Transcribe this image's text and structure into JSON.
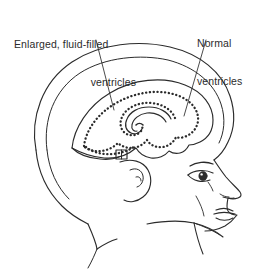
{
  "figure": {
    "type": "medical-illustration",
    "view": "lateral-profile",
    "background_color": "#ffffff",
    "line_color": "#2b2b2b",
    "labels": {
      "enlarged": {
        "line1": "Enlarged, fluid-filled",
        "line2": "ventricles"
      },
      "normal": {
        "line1": "Normal",
        "line2": "ventricles"
      }
    },
    "parts": [
      "skull-outer-outline",
      "skull-inner-outline",
      "brain-outline",
      "enlarged-ventricle-dotted-outline",
      "normal-ventricle-inner-outline",
      "brainstem-connector",
      "ear",
      "eyebrow",
      "eye",
      "nose",
      "lips",
      "chin",
      "neck",
      "shoulder"
    ],
    "leader_lines": [
      {
        "name": "leader-enlarged",
        "from": [
          96,
          40
        ],
        "to": [
          114,
          110
        ]
      },
      {
        "name": "leader-normal",
        "from": [
          206,
          40
        ],
        "to": [
          184,
          116
        ]
      }
    ]
  }
}
